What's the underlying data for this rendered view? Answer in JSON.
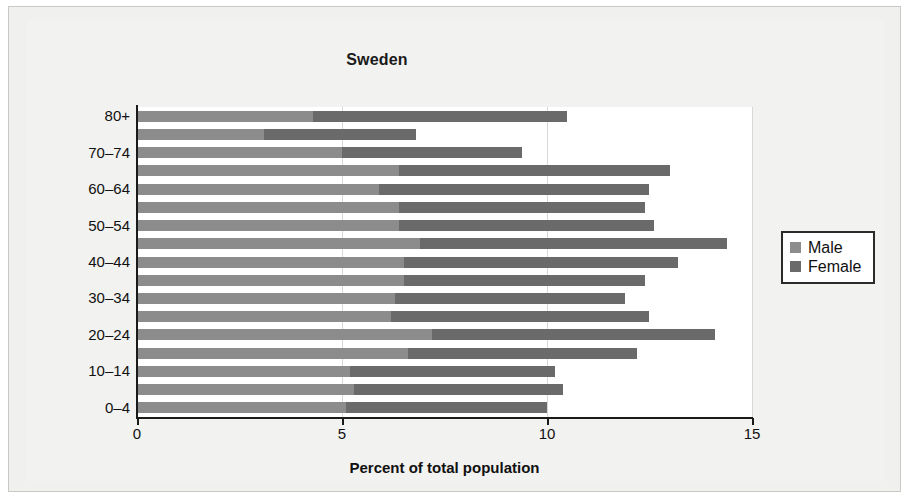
{
  "chart_data": {
    "type": "bar",
    "orientation": "horizontal",
    "stacked": true,
    "title": "Sweden",
    "xlabel": "Percent of total population",
    "ylabel": "",
    "xlim": [
      0,
      15
    ],
    "xticks": [
      "0",
      "5",
      "10",
      "15"
    ],
    "xtick_values": [
      0,
      5,
      10,
      15
    ],
    "grid": "vertical-light",
    "legend_position": "right",
    "categories": [
      "80+",
      "75–79",
      "70–74",
      "65–69",
      "60–64",
      "55–59",
      "50–54",
      "45–49",
      "40–44",
      "35–39",
      "30–34",
      "25–29",
      "20–24",
      "15–19",
      "10–14",
      "5–9",
      "0–4"
    ],
    "visible_tick_labels": [
      "80+",
      "",
      "70–74",
      "",
      "60–64",
      "",
      "50–54",
      "",
      "40–44",
      "",
      "30–34",
      "",
      "20–24",
      "",
      "10–14",
      "",
      "0–4"
    ],
    "series": [
      {
        "name": "Male",
        "color": "#8c8c8c",
        "values": [
          4.3,
          3.1,
          5.0,
          6.4,
          5.9,
          6.4,
          6.4,
          6.9,
          6.5,
          6.5,
          6.3,
          6.2,
          7.2,
          6.6,
          5.2,
          5.3,
          5.1
        ]
      },
      {
        "name": "Female",
        "color": "#6a6a6a",
        "values": [
          6.2,
          3.7,
          4.4,
          6.6,
          6.6,
          6.0,
          6.2,
          7.5,
          6.7,
          5.9,
          5.6,
          6.3,
          6.9,
          5.6,
          5.0,
          5.1,
          4.9
        ]
      }
    ],
    "totals": [
      10.5,
      6.8,
      9.4,
      13.0,
      12.5,
      12.4,
      12.6,
      14.4,
      13.2,
      12.4,
      11.9,
      12.5,
      14.1,
      12.2,
      10.2,
      10.4,
      10.0
    ]
  },
  "legend": {
    "items": [
      {
        "label": "Male",
        "color": "#8c8c8c"
      },
      {
        "label": "Female",
        "color": "#6a6a6a"
      }
    ]
  },
  "colors": {
    "male": "#8c8c8c",
    "female": "#6a6a6a",
    "axis": "#1a1a1a",
    "grid": "#d8d8d8",
    "page_background": "#f0f0ee",
    "plot_background": "#ffffff",
    "text": "#111111"
  }
}
